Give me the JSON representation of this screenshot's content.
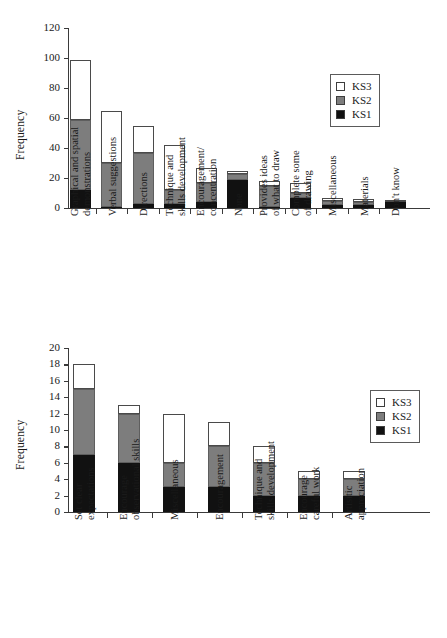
{
  "chart_data": [
    {
      "id": "top",
      "type": "bar",
      "stacked": true,
      "title": "",
      "xlabel": "",
      "ylabel": "Frequency",
      "ylim": [
        0,
        120
      ],
      "yticks": [
        0,
        20,
        40,
        60,
        80,
        100,
        120
      ],
      "grid": false,
      "legend_position": "upper right",
      "legend": [
        "KS3",
        "KS2",
        "KS1"
      ],
      "categories": [
        "Graphical and spatial demonstrations",
        "Verbal suggestions",
        "Directions",
        "Technique and skills development",
        "Encouragement/ concentration",
        "None",
        "Provides ideas of what to draw",
        "Complete some of drawing",
        "Miscellaneous",
        "Materials",
        "Don't know"
      ],
      "category_lines": [
        [
          "Graphical and spatial",
          "demonstrations"
        ],
        [
          "Verbal suggestions",
          ""
        ],
        [
          "Directions",
          ""
        ],
        [
          "Technique and",
          "skills development"
        ],
        [
          "Encouragement/",
          "concentration"
        ],
        [
          "None",
          ""
        ],
        [
          "Provides ideas",
          "of what to draw"
        ],
        [
          "Complete some",
          "of drawing"
        ],
        [
          "Miscellaneous",
          ""
        ],
        [
          "Materials",
          ""
        ],
        [
          "Don't know",
          ""
        ]
      ],
      "series": [
        {
          "name": "KS1",
          "values": [
            12,
            1,
            3,
            3,
            4,
            19,
            1,
            7,
            2,
            2,
            4
          ]
        },
        {
          "name": "KS2",
          "values": [
            47,
            29,
            34,
            9,
            13,
            4,
            14,
            3,
            3,
            2,
            0
          ]
        },
        {
          "name": "KS3",
          "values": [
            40,
            35,
            18,
            30,
            10,
            2,
            3,
            7,
            2,
            2,
            1
          ]
        }
      ],
      "totals": [
        99,
        65,
        55,
        42,
        27,
        25,
        18,
        17,
        7,
        6,
        5
      ]
    },
    {
      "id": "bottom",
      "type": "bar",
      "stacked": true,
      "title": "",
      "xlabel": "",
      "ylabel": "Frequency",
      "ylim": [
        0,
        20
      ],
      "yticks": [
        0,
        2,
        4,
        6,
        8,
        10,
        12,
        14,
        16,
        18,
        20
      ],
      "grid": false,
      "legend_position": "right",
      "legend": [
        "KS3",
        "KS2",
        "KS1"
      ],
      "categories": [
        "Set clear expectations",
        "Encourage observational skills",
        "Miscellaneous",
        "Encouragement",
        "Technique and skills development",
        "Encourage careful work",
        "Artisitic appreciation"
      ],
      "category_lines": [
        [
          "Set clear",
          "expectations"
        ],
        [
          "Encourage",
          "observational skills"
        ],
        [
          "Miscellaneous",
          ""
        ],
        [
          "Encouragement",
          ""
        ],
        [
          "Technique and",
          "skills development"
        ],
        [
          "Encourage",
          "careful work"
        ],
        [
          "Artisitic",
          "appreciation"
        ]
      ],
      "series": [
        {
          "name": "KS1",
          "values": [
            7,
            6,
            3,
            3,
            2,
            2,
            2
          ]
        },
        {
          "name": "KS2",
          "values": [
            8,
            6,
            3,
            5,
            4,
            2,
            2
          ]
        },
        {
          "name": "KS3",
          "values": [
            3,
            1,
            6,
            3,
            2,
            1,
            1
          ]
        }
      ],
      "totals": [
        18,
        13,
        12,
        11,
        8,
        5,
        5
      ]
    }
  ],
  "colors": {
    "ks1": "#111111",
    "ks2": "#7d7d7d",
    "ks3": "#ffffff",
    "axis": "#3a3a3a",
    "text": "#1a1a1a"
  }
}
